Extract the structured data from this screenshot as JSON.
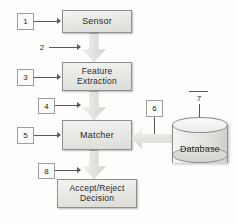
{
  "diagram": {
    "type": "block-diagram",
    "background_color": "#fdfdfc",
    "box_fill_color": "#e9e9e6",
    "box_border_color": "#8f8f8f",
    "text_color": "#2b2b2b"
  },
  "nodes": [
    {
      "id": "sensor",
      "label": "Sensor",
      "shape": "rectangle",
      "lines": [
        "Sensor"
      ]
    },
    {
      "id": "feature_extraction",
      "label": "Feature Extraction",
      "shape": "rectangle",
      "lines": [
        "Feature",
        "Extraction"
      ]
    },
    {
      "id": "matcher",
      "label": "Matcher",
      "shape": "rectangle",
      "lines": [
        "Matcher"
      ]
    },
    {
      "id": "decision",
      "label": "Accept/Reject Decision",
      "shape": "rectangle",
      "lines": [
        "Accept/Reject",
        "Decision"
      ]
    },
    {
      "id": "database",
      "label": "Database",
      "shape": "cylinder",
      "lines": [
        "Database"
      ]
    }
  ],
  "callouts": [
    {
      "id": "c1",
      "number": "1",
      "style": "boxed",
      "target": "sensor"
    },
    {
      "id": "c2",
      "number": "2",
      "style": "plain",
      "target": "sensor-to-feature-arrow"
    },
    {
      "id": "c3",
      "number": "3",
      "style": "boxed",
      "target": "feature_extraction"
    },
    {
      "id": "c4",
      "number": "4",
      "style": "boxed",
      "target": "feature-to-matcher-arrow"
    },
    {
      "id": "c5",
      "number": "5",
      "style": "boxed",
      "target": "matcher"
    },
    {
      "id": "c6",
      "number": "6",
      "style": "boxed",
      "target": "database-to-matcher-arrow"
    },
    {
      "id": "c7",
      "number": "7",
      "style": "plain",
      "target": "database"
    },
    {
      "id": "c8",
      "number": "8",
      "style": "boxed",
      "target": "matcher-to-decision-arrow"
    }
  ],
  "connectors": [
    {
      "id": "sensor-to-feature-arrow",
      "from": "sensor",
      "to": "feature_extraction",
      "direction": "down",
      "kind": "block-arrow"
    },
    {
      "id": "feature-to-matcher-arrow",
      "from": "feature_extraction",
      "to": "matcher",
      "direction": "down",
      "kind": "block-arrow"
    },
    {
      "id": "matcher-to-decision-arrow",
      "from": "matcher",
      "to": "decision",
      "direction": "down",
      "kind": "block-arrow"
    },
    {
      "id": "database-to-matcher-arrow",
      "from": "database",
      "to": "matcher",
      "direction": "left",
      "kind": "block-arrow"
    }
  ]
}
